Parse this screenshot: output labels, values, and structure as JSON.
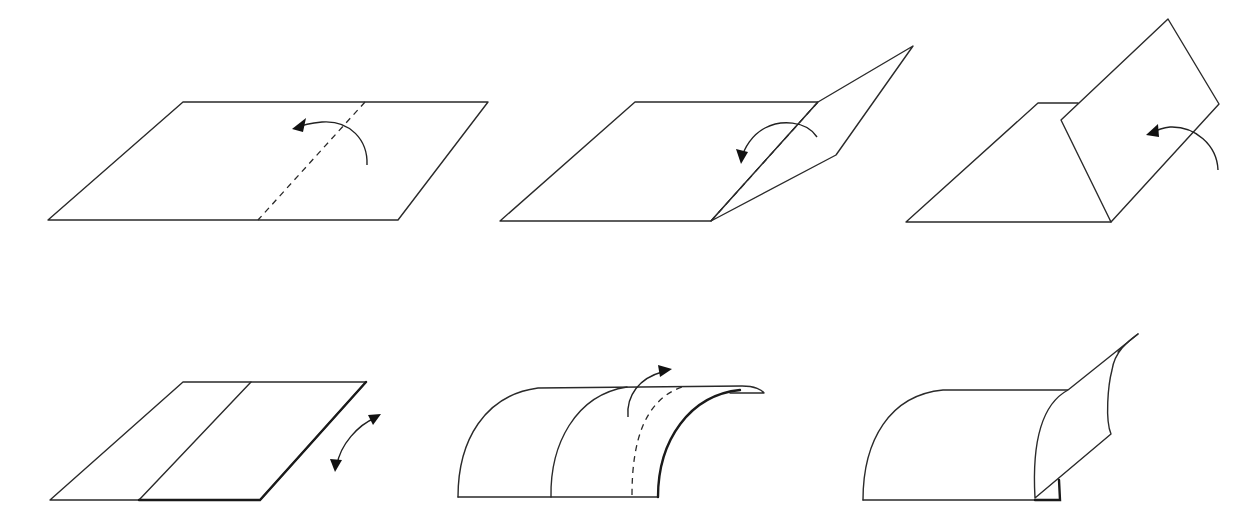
{
  "diagram": {
    "title": "",
    "colors": {
      "stroke": "#2a2a2a",
      "background": "#ffffff",
      "arrow": "#111111"
    },
    "steps": [
      {
        "id": "step-1",
        "description": "Flat sheet with dashed fold line; arrow shows folding right part over to the left",
        "shapes": [
          {
            "kind": "edge",
            "d": "M48,220 L183,102 L488,102 L398,220 Z"
          },
          {
            "kind": "dash",
            "d": "M365,102 L258,220"
          },
          {
            "kind": "arrow",
            "d": "M367,165 C368,140 350,120 322,122 C310,123 300,126 296,128"
          }
        ],
        "heads": [
          {
            "points": "292,129 306,118 303,132"
          }
        ]
      },
      {
        "id": "step-2",
        "description": "Right part lifted along dashed fold; arrow shows continued folding",
        "shapes": [
          {
            "kind": "edge",
            "d": "M500,221 L635,102 L818,102 L711,221 Z"
          },
          {
            "kind": "edge",
            "d": "M818,102 L913,46 L836,155 L711,221 Z"
          },
          {
            "kind": "dash",
            "d": "M818,102 L711,221"
          },
          {
            "kind": "arrow",
            "d": "M817,137 C806,120 780,120 765,128 C752,135 744,148 742,158"
          }
        ],
        "heads": [
          {
            "points": "741,164 736,149 748,152"
          }
        ]
      },
      {
        "id": "step-3",
        "description": "Flap standing upright over base; arrow indicates bringing flap down",
        "shapes": [
          {
            "kind": "edge",
            "d": "M906,222 L1038,103 L1078,103 L1111,222 Z"
          },
          {
            "kind": "edge",
            "d": "M1061,120 L1168,19 L1219,104 L1111,222 Z"
          },
          {
            "kind": "arrow",
            "d": "M1218,170 C1217,145 1195,126 1170,127 C1162,128 1155,131 1151,133"
          }
        ],
        "heads": [
          {
            "points": "1146,135 1158,124 1159,137"
          }
        ]
      },
      {
        "id": "step-4",
        "description": "Sheet folded in half with crease; double-headed arrow shows moving the top layer",
        "shapes": [
          {
            "kind": "edge",
            "d": "M50,500 L183,382 L366,382 L260,500 Z"
          },
          {
            "kind": "line",
            "d": "M251,382 L139,500"
          },
          {
            "kind": "bold",
            "d": "M139,500 L260,500 L366,382"
          },
          {
            "kind": "arrow",
            "d": "M337,465 C340,445 358,425 375,418"
          }
        ],
        "heads": [
          {
            "points": "381,414 368,415 373,425"
          },
          {
            "points": "335,472 330,459 342,460"
          }
        ]
      },
      {
        "id": "step-5",
        "description": "Curved sheet with dashed crease; arrow indicates curling the edge up and over",
        "shapes": [
          {
            "kind": "line",
            "d": "M458,497 L658,497"
          },
          {
            "kind": "line",
            "d": "M458,497 C458,440 485,395 538,388 L742,386 C755,386 762,390 764,393 L730,393"
          },
          {
            "kind": "line",
            "d": "M551,497 C550,445 575,395 627,387"
          },
          {
            "kind": "dash",
            "d": "M632,495 C632,440 645,400 682,387"
          },
          {
            "kind": "bold",
            "d": "M658,497 C658,440 690,395 740,390"
          },
          {
            "kind": "arrow",
            "d": "M628,417 C626,395 640,378 662,372"
          }
        ],
        "heads": [
          {
            "points": "672,369 658,365 660,377"
          }
        ]
      },
      {
        "id": "step-6",
        "description": "Curved sheet with flap peeling up at the right edge",
        "shapes": [
          {
            "kind": "line",
            "d": "M863,500 L1060,500"
          },
          {
            "kind": "line",
            "d": "M863,500 C863,440 890,395 943,390 L1068,390"
          },
          {
            "kind": "edge",
            "d": "M1035,498 C1032,445 1040,405 1068,390 L1138,334 C1130,340 1115,350 1112,370 C1108,385 1105,420 1111,434 Z"
          },
          {
            "kind": "line",
            "d": "M1138,334 C1128,342 1120,348 1118,352"
          },
          {
            "kind": "bold",
            "d": "M1035,500 L1060,500 L1059,480"
          }
        ],
        "heads": []
      }
    ]
  }
}
